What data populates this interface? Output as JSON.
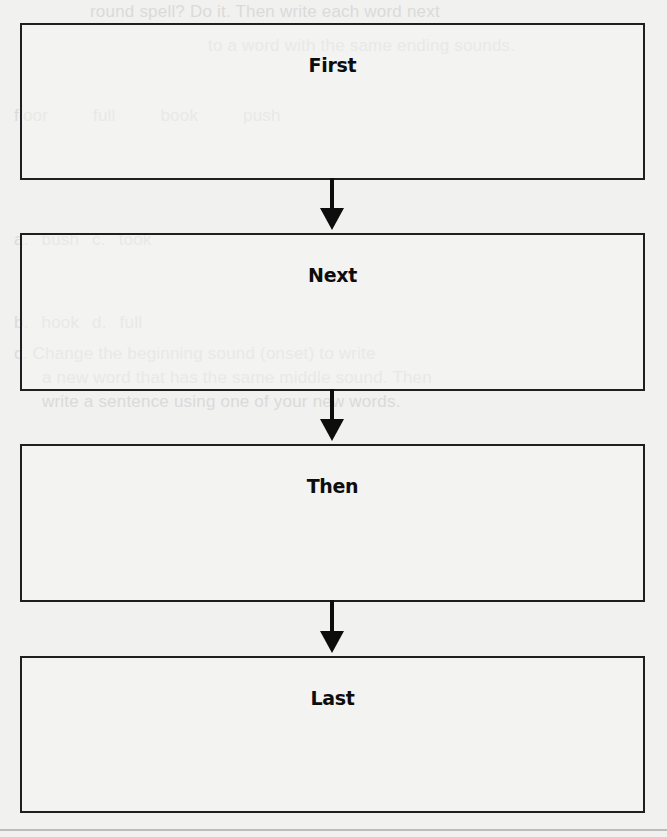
{
  "diagram": {
    "type": "sequence-flowchart",
    "boxes": [
      {
        "label": "First"
      },
      {
        "label": "Next"
      },
      {
        "label": "Then"
      },
      {
        "label": "Last"
      }
    ],
    "arrows": [
      {
        "from": "First",
        "to": "Next"
      },
      {
        "from": "Next",
        "to": "Then"
      },
      {
        "from": "Then",
        "to": "Last"
      }
    ],
    "colors": {
      "paper": "#f1f1f0",
      "border": "#1f1f1f",
      "text": "#0d0d0d",
      "arrow": "#0d0d0d"
    }
  },
  "background_bleed": {
    "lines": [
      "round spell? Do it. Then write each word next",
      "to a word with the same ending sounds.",
      "floor        full        book        push",
      "a. bush                          c. took",
      "b. hook                          d. full",
      "c. Change the beginning sound (onset) to write",
      "a new word that has the same middle sound. Then",
      "write a sentence using one of your new words."
    ]
  }
}
